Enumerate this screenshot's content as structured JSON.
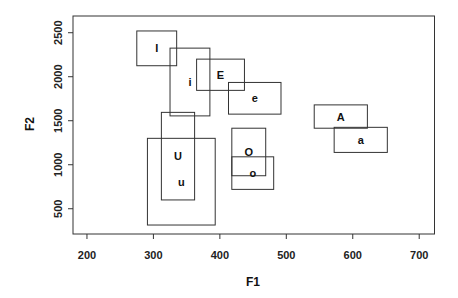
{
  "chart_data": {
    "type": "rectangles",
    "title": "",
    "xlabel": "F1",
    "ylabel": "F2",
    "xlim": [
      179,
      723
    ],
    "ylim": [
      213,
      2690
    ],
    "xticks": [
      200,
      300,
      400,
      500,
      600,
      700
    ],
    "yticks": [
      500,
      1000,
      1500,
      2000,
      2500
    ],
    "grid": false,
    "legend": null,
    "boxes": [
      {
        "label": "I",
        "x": [
          275,
          335
        ],
        "y": [
          2125,
          2520
        ]
      },
      {
        "label": "i",
        "x": [
          325,
          385
        ],
        "y": [
          1555,
          2325
        ]
      },
      {
        "label": "E",
        "x": [
          365,
          437
        ],
        "y": [
          1845,
          2200
        ]
      },
      {
        "label": "e",
        "x": [
          413,
          492
        ],
        "y": [
          1575,
          1935
        ]
      },
      {
        "label": "A",
        "x": [
          542,
          622
        ],
        "y": [
          1415,
          1680
        ]
      },
      {
        "label": "a",
        "x": [
          572,
          652
        ],
        "y": [
          1140,
          1425
        ]
      },
      {
        "label": "O",
        "x": [
          418,
          469
        ],
        "y": [
          875,
          1415
        ]
      },
      {
        "label": "o",
        "x": [
          418,
          481
        ],
        "y": [
          720,
          1090
        ]
      },
      {
        "label": "U",
        "x": [
          312,
          362
        ],
        "y": [
          600,
          1595
        ]
      },
      {
        "label": "u",
        "x": [
          291,
          393
        ],
        "y": [
          315,
          1300
        ]
      }
    ]
  }
}
